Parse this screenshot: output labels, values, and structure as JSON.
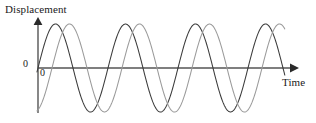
{
  "figure": {
    "title": "",
    "y_axis_title": "Displacement",
    "x_axis_title": "Time",
    "y_zero_label": "0",
    "x_zero_label": "0",
    "axis_color": "#555555",
    "wave_a_color": "#3a3a3a",
    "wave_b_color": "#9a9a9a",
    "background": "#ffffff"
  },
  "chart_data": {
    "type": "line",
    "title": "",
    "xlabel": "Time",
    "ylabel": "Displacement",
    "grid": false,
    "legend": "none",
    "xlim": [
      0,
      3.6
    ],
    "ylim": [
      -1.15,
      1.15
    ],
    "x_axis_origin_label": "0",
    "y_axis_origin_label": "0",
    "x": [
      0,
      0.1,
      0.2,
      0.3,
      0.4,
      0.5,
      0.6,
      0.7,
      0.8,
      0.9,
      1.0,
      1.1,
      1.2,
      1.3,
      1.4,
      1.5,
      1.6,
      1.7,
      1.8,
      1.9,
      2.0,
      2.1,
      2.2,
      2.3,
      2.4,
      2.5,
      2.6,
      2.7,
      2.8,
      2.9,
      3.0,
      3.1,
      3.2,
      3.3,
      3.4,
      3.5,
      3.6
    ],
    "series": [
      {
        "name": "wave-a",
        "color": "#3a3a3a",
        "amplitude": 1.0,
        "wavelength": 1.0,
        "phase_deg": 0,
        "start_value": 0,
        "values": [
          0,
          0.588,
          0.951,
          0.951,
          0.588,
          0,
          -0.588,
          -0.951,
          -0.951,
          -0.588,
          0,
          0.588,
          0.951,
          0.951,
          0.588,
          0,
          -0.588,
          -0.951,
          -0.951,
          -0.588,
          0,
          0.588,
          0.951,
          0.951,
          0.588,
          0,
          -0.588,
          -0.951,
          -0.951,
          -0.588,
          0,
          0.588,
          0.951,
          0.951,
          0.588,
          0,
          -0.588
        ]
      },
      {
        "name": "wave-b",
        "color": "#9a9a9a",
        "amplitude": 1.0,
        "wavelength": 1.0,
        "phase_deg": -72,
        "start_value": -0.951,
        "values": [
          -0.951,
          -0.588,
          0,
          0.588,
          0.951,
          0.951,
          0.588,
          0,
          -0.588,
          -0.951,
          -0.951,
          -0.588,
          0,
          0.588,
          0.951,
          0.951,
          0.588,
          0,
          -0.588,
          -0.951,
          -0.951,
          -0.588,
          0,
          0.588,
          0.951,
          0.951,
          0.588,
          0,
          -0.588,
          -0.951,
          -0.951,
          -0.588,
          0,
          0.588,
          0.951,
          0.951,
          0.588
        ]
      }
    ],
    "cycles_shown": 3.5,
    "phase_difference_note": "constant phase lag between the two waves"
  }
}
